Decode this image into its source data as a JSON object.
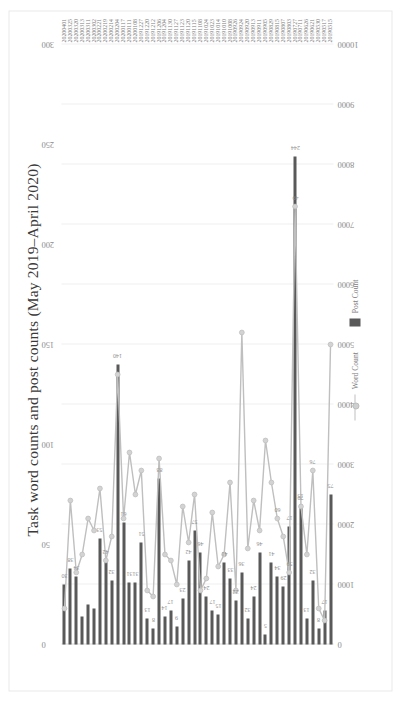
{
  "figure": {
    "title": "Task word counts and  post counts (May 2019–April 2020)",
    "background": "#ffffff",
    "rotation": "-90deg"
  },
  "legend": {
    "position": "bottom-center",
    "items": [
      {
        "label": "Word Count",
        "marker": "line-with-circle",
        "color": "#bfbfbf"
      },
      {
        "label": "Post Count",
        "marker": "bar",
        "color": "#595959"
      }
    ]
  },
  "chart_data": {
    "type": "bar",
    "title": "Task word counts and  post counts (May 2019–April 2020)",
    "xlabel": "",
    "ylabel": "",
    "grid": true,
    "legend_position": "bottom",
    "bottom_axis": {
      "name": "Word Count",
      "ticks": [
        "0",
        "1000",
        "2000",
        "3000",
        "4000",
        "5000",
        "6000",
        "7000",
        "8000",
        "9000",
        "10000"
      ],
      "lim": [
        0,
        10000
      ]
    },
    "top_axis": {
      "name": "Post Count",
      "ticks": [
        "0",
        "50",
        "100",
        "150",
        "200",
        "250",
        "300"
      ],
      "lim": [
        0,
        300
      ]
    },
    "categories": [
      "20190515",
      "20190517",
      "20190530",
      "20190621",
      "20190626",
      "20190711",
      "20190727",
      "20190803",
      "20190807",
      "20190815",
      "20190829",
      "20190905",
      "20190911",
      "20190913",
      "20190920",
      "20190924",
      "20190926",
      "20191008",
      "20191010",
      "20191014",
      "20191023",
      "20191024",
      "20191108",
      "20191115",
      "20191120",
      "20191123",
      "20191127",
      "20191130",
      "20191204",
      "20191206",
      "20191212",
      "20191220",
      "20191227",
      "20200108",
      "20200111",
      "20200117",
      "20200204",
      "20200214",
      "20200219",
      "20200221",
      "20200302",
      "20200311",
      "20200313",
      "20200320",
      "20200325",
      "20200401"
    ],
    "series": [
      {
        "name": "Word Count",
        "axis": "bottom",
        "type": "line",
        "color": "#bfbfbf",
        "values": [
          5000,
          400,
          600,
          2900,
          1500,
          2300,
          7300,
          1200,
          1800,
          2100,
          2700,
          3400,
          1900,
          2400,
          1600,
          5200,
          900,
          2700,
          1500,
          1300,
          2200,
          1100,
          900,
          2500,
          1700,
          2300,
          1000,
          1400,
          1500,
          3100,
          800,
          900,
          2900,
          2500,
          3200,
          2100,
          4500,
          1800,
          1400,
          2600,
          1900,
          2100,
          1500,
          1200,
          2400,
          600
        ]
      },
      {
        "name": "Post Count",
        "axis": "top",
        "type": "bar",
        "color": "#595959",
        "values": [
          75,
          17,
          8,
          32,
          13,
          70,
          244,
          59,
          29,
          34,
          41,
          5,
          46,
          24,
          13,
          36,
          22,
          33,
          41,
          15,
          17,
          24,
          46,
          57,
          42,
          23,
          9,
          17,
          14,
          83,
          8,
          13,
          51,
          31,
          31,
          61,
          140,
          32,
          42,
          53,
          18,
          20,
          14,
          34,
          38,
          30
        ]
      }
    ],
    "data_labels": [
      {
        "category": "20190515",
        "series": "Post Count",
        "value": "75"
      },
      {
        "category": "20190517",
        "series": "Post Count",
        "value": "17"
      },
      {
        "category": "20190530",
        "series": "Post Count",
        "value": "8"
      },
      {
        "category": "20190621",
        "series": "Post Count",
        "value": "32"
      },
      {
        "category": "20190621",
        "series": "Word Count",
        "value": "76"
      },
      {
        "category": "20190626",
        "series": "Post Count",
        "value": "13"
      },
      {
        "category": "20190711",
        "series": "Post Count",
        "value": "15"
      },
      {
        "category": "20190711",
        "series": "Word Count",
        "value": "70"
      },
      {
        "category": "20190727",
        "series": "Post Count",
        "value": "244"
      },
      {
        "category": "20190727",
        "series": "Word Count",
        "value": "49"
      },
      {
        "category": "20190803",
        "series": "Post Count",
        "value": "17"
      },
      {
        "category": "20190803",
        "series": "Word Count",
        "value": "59"
      },
      {
        "category": "20190807",
        "series": "Post Count",
        "value": "29"
      },
      {
        "category": "20190815",
        "series": "Word Count",
        "value": "60"
      },
      {
        "category": "20190815",
        "series": "Post Count",
        "value": "34"
      },
      {
        "category": "20190829",
        "series": "Post Count",
        "value": "41"
      },
      {
        "category": "20190905",
        "series": "Post Count",
        "value": "5"
      },
      {
        "category": "20190911",
        "series": "Post Count",
        "value": "46"
      },
      {
        "category": "20190913",
        "series": "Post Count",
        "value": "24"
      },
      {
        "category": "20190920",
        "series": "Post Count",
        "value": "32"
      },
      {
        "category": "20190924",
        "series": "Post Count",
        "value": "36"
      },
      {
        "category": "20190926",
        "series": "Post Count",
        "value": "22"
      },
      {
        "category": "20191008",
        "series": "Post Count",
        "value": "33"
      },
      {
        "category": "20191010",
        "series": "Post Count",
        "value": "41"
      },
      {
        "category": "20191014",
        "series": "Post Count",
        "value": "15"
      },
      {
        "category": "20191023",
        "series": "Post Count",
        "value": "17"
      },
      {
        "category": "20191024",
        "series": "Post Count",
        "value": "24"
      },
      {
        "category": "20191108",
        "series": "Post Count",
        "value": "46"
      },
      {
        "category": "20191115",
        "series": "Post Count",
        "value": "57"
      },
      {
        "category": "20191120",
        "series": "Post Count",
        "value": "42"
      },
      {
        "category": "20191123",
        "series": "Post Count",
        "value": "23"
      },
      {
        "category": "20191127",
        "series": "Post Count",
        "value": "9"
      },
      {
        "category": "20191130",
        "series": "Post Count",
        "value": "17"
      },
      {
        "category": "20191204",
        "series": "Post Count",
        "value": "14"
      },
      {
        "category": "20191206",
        "series": "Post Count",
        "value": "83"
      },
      {
        "category": "20191212",
        "series": "Post Count",
        "value": "8"
      },
      {
        "category": "20191220",
        "series": "Post Count",
        "value": "13"
      },
      {
        "category": "20191227",
        "series": "Post Count",
        "value": "51"
      },
      {
        "category": "20200108",
        "series": "Post Count",
        "value": "31"
      },
      {
        "category": "20200111",
        "series": "Post Count",
        "value": "31"
      },
      {
        "category": "20200117",
        "series": "Post Count",
        "value": "61"
      },
      {
        "category": "20200204",
        "series": "Post Count",
        "value": "140"
      },
      {
        "category": "20200214",
        "series": "Post Count",
        "value": "32"
      },
      {
        "category": "20200219",
        "series": "Post Count",
        "value": "42"
      },
      {
        "category": "20200221",
        "series": "Post Count",
        "value": "53"
      },
      {
        "category": "20200320",
        "series": "Post Count",
        "value": "34"
      },
      {
        "category": "20200325",
        "series": "Post Count",
        "value": "38"
      },
      {
        "category": "20200401",
        "series": "Post Count",
        "value": "30"
      }
    ]
  }
}
